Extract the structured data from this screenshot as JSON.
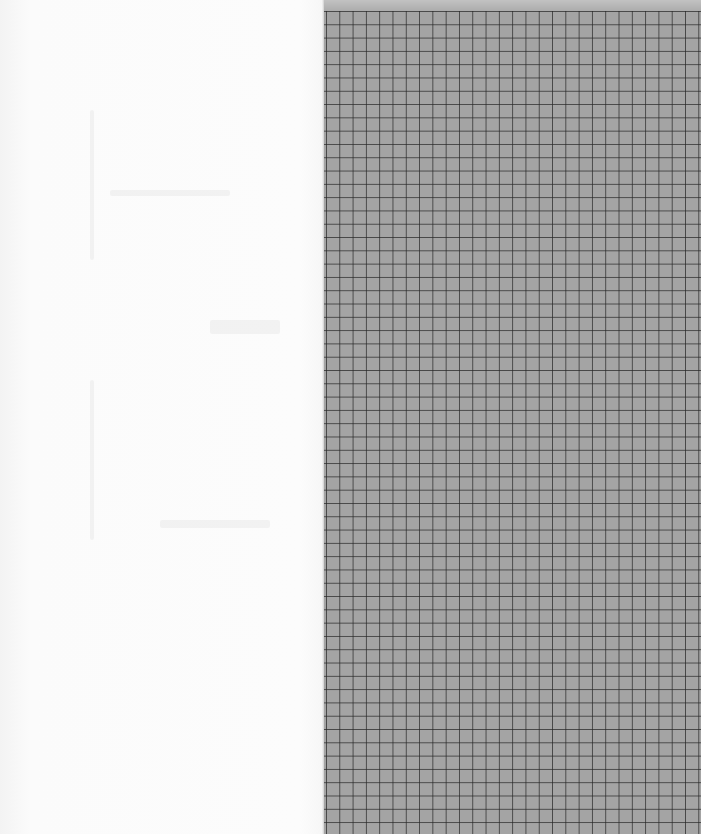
{
  "scene": {
    "description": "Open notebook spread: blank left page, graph-paper right page",
    "left_page": {
      "content": "",
      "color": "#fbfbfb"
    },
    "right_page": {
      "pattern": "square-grid",
      "paper_color": "#a4a4a4",
      "line_color": "#282828",
      "cell_size_px": 13.3,
      "top_strip_color": "#c2c2c2"
    }
  }
}
